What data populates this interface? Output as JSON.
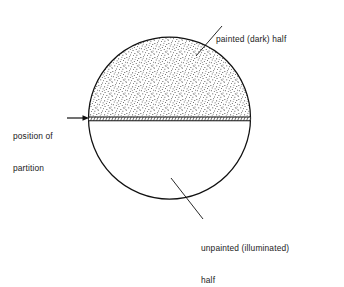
{
  "figure": {
    "background_color": "#ffffff",
    "line_color": "#111111",
    "stipple_color": "#3a3a3a",
    "circle": {
      "cx": 169.5,
      "cy": 118,
      "r": 81
    },
    "partition": {
      "y_top": 116.5,
      "y_bottom": 121,
      "x_left": 88.5,
      "x_right": 250.5
    }
  },
  "labels": {
    "painted": {
      "icon": "leader-line-icon",
      "lines": [
        "painted (dark) half"
      ],
      "leader": {
        "x1": 196,
        "y1": 56,
        "x2": 222,
        "y2": 26
      }
    },
    "position": {
      "icon": "arrow-right-icon",
      "lines": [
        "position of",
        "partition"
      ],
      "arrow": {
        "x1": 67,
        "y1": 118,
        "x2": 88,
        "y2": 118
      }
    },
    "unpainted": {
      "icon": "leader-line-icon",
      "lines": [
        "unpainted (illuminated)",
        "half"
      ],
      "leader": {
        "x1": 171,
        "y1": 178,
        "x2": 203,
        "y2": 219
      }
    }
  },
  "regions": {
    "upper_half_name": "painted (dark) half",
    "lower_half_name": "unpainted (illuminated) half",
    "partition_name": "position of partition"
  }
}
